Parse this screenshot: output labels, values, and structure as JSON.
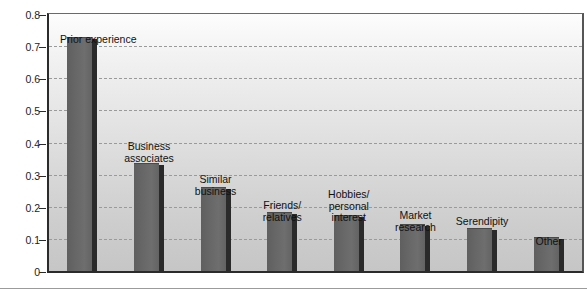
{
  "chart_data": {
    "type": "bar",
    "title": "",
    "subtitle": "",
    "xlabel": "",
    "ylabel": "",
    "ylim": [
      0,
      0.8
    ],
    "yticks": [
      "0",
      "0.1",
      "0.2",
      "0.3",
      "0.4",
      "0.5",
      "0.6",
      "0.7",
      "0.8"
    ],
    "ytick_values": [
      0,
      0.1,
      0.2,
      0.3,
      0.4,
      0.5,
      0.6,
      0.7,
      0.8
    ],
    "grid": "horizontal-dashed",
    "legend": "none",
    "categories": [
      "Prior experience",
      "Business\nassociates",
      "Similar\nbusiness",
      "Friends/\nrelatives",
      "Hobbies/\npersonal\ninterest",
      "Market\nresearch",
      "Serendipity",
      "Other"
    ],
    "values": [
      0.73,
      0.335,
      0.26,
      0.185,
      0.175,
      0.145,
      0.135,
      0.105
    ],
    "bar_color": "#676767",
    "bar_shadow_color": "#2a2a2a",
    "gridline_color": "#9a9a9a",
    "axis_color": "#2b2b2b",
    "plot_background": "#e0e0e0"
  },
  "axis": {
    "ticks": [
      {
        "label": "0.8",
        "value": 0.8
      },
      {
        "label": "0.7",
        "value": 0.7
      },
      {
        "label": "0.6",
        "value": 0.6
      },
      {
        "label": "0.5",
        "value": 0.5
      },
      {
        "label": "0.4",
        "value": 0.4
      },
      {
        "label": "0.3",
        "value": 0.3
      },
      {
        "label": "0.2",
        "value": 0.2
      },
      {
        "label": "0.1",
        "value": 0.1
      },
      {
        "label": "0",
        "value": 0
      }
    ]
  },
  "bars": [
    {
      "label": "Prior experience",
      "value": 0.73,
      "label_lines": [
        "Prior experience"
      ]
    },
    {
      "label": "Business associates",
      "value": 0.335,
      "label_lines": [
        "Business",
        "associates"
      ]
    },
    {
      "label": "Similar business",
      "value": 0.26,
      "label_lines": [
        "Similar",
        "business"
      ]
    },
    {
      "label": "Friends/relatives",
      "value": 0.185,
      "label_lines": [
        "Friends/",
        "relatives"
      ]
    },
    {
      "label": "Hobbies/personal interest",
      "value": 0.175,
      "label_lines": [
        "Hobbies/",
        "personal",
        "interest"
      ]
    },
    {
      "label": "Market research",
      "value": 0.145,
      "label_lines": [
        "Market",
        "research"
      ]
    },
    {
      "label": "Serendipity",
      "value": 0.135,
      "label_lines": [
        "Serendipity"
      ]
    },
    {
      "label": "Other",
      "value": 0.105,
      "label_lines": [
        "Other"
      ]
    }
  ]
}
